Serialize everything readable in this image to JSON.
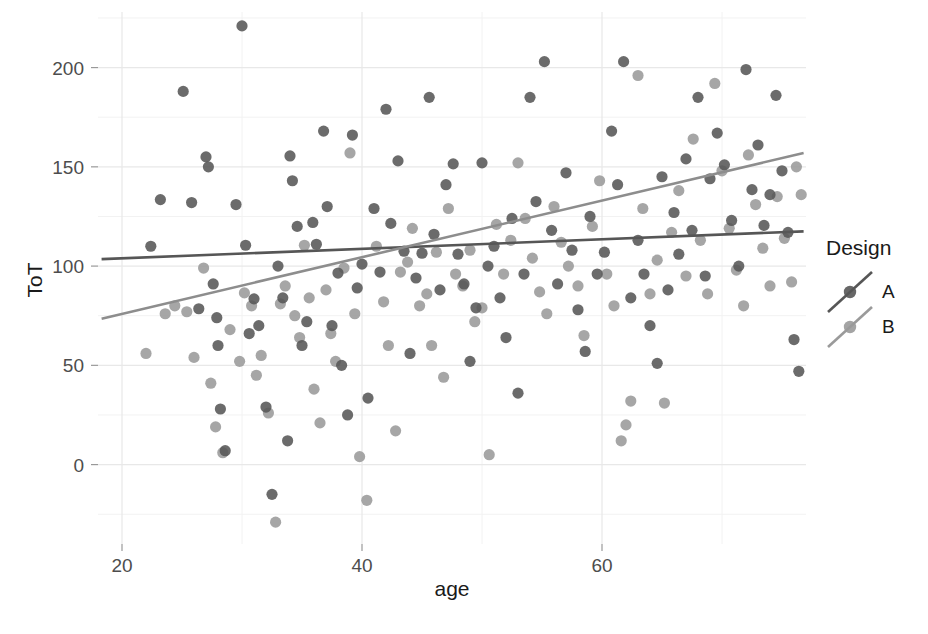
{
  "chart_data": {
    "type": "scatter",
    "title": "",
    "xlabel": "age",
    "ylabel": "ToT",
    "xlim": [
      18,
      77
    ],
    "ylim": [
      -40,
      228
    ],
    "xticks": [
      20,
      40,
      60
    ],
    "yticks": [
      0,
      50,
      100,
      150,
      200
    ],
    "grid": true,
    "legend": {
      "title": "Design",
      "position": "right",
      "entries": [
        {
          "name": "A",
          "color": "#565656",
          "marker": "circle"
        },
        {
          "name": "B",
          "color": "#9a9a9a",
          "marker": "circle"
        }
      ]
    },
    "trend_lines": [
      {
        "name": "A",
        "color": "#565656",
        "x0": 18.3,
        "y0": 103.5,
        "x1": 76.8,
        "y1": 117.5
      },
      {
        "name": "B",
        "color": "#8d8d8d",
        "x0": 18.3,
        "y0": 73.5,
        "x1": 76.8,
        "y1": 157.0
      }
    ],
    "series": [
      {
        "name": "A",
        "color": "#565656",
        "points": [
          [
            22.4,
            110.0
          ],
          [
            23.2,
            133.5
          ],
          [
            25.1,
            188.0
          ],
          [
            25.8,
            132.0
          ],
          [
            26.4,
            78.5
          ],
          [
            27.0,
            155.0
          ],
          [
            27.2,
            150.0
          ],
          [
            27.6,
            91.0
          ],
          [
            27.9,
            74.0
          ],
          [
            28.0,
            60.0
          ],
          [
            28.2,
            28.0
          ],
          [
            28.6,
            7.0
          ],
          [
            29.5,
            131.0
          ],
          [
            30.0,
            221.0
          ],
          [
            30.3,
            110.5
          ],
          [
            30.6,
            66.0
          ],
          [
            31.0,
            83.5
          ],
          [
            31.4,
            70.0
          ],
          [
            32.0,
            29.0
          ],
          [
            32.5,
            -15.0
          ],
          [
            33.0,
            100.0
          ],
          [
            33.4,
            84.0
          ],
          [
            33.8,
            12.0
          ],
          [
            34.0,
            155.5
          ],
          [
            34.2,
            143.0
          ],
          [
            34.6,
            120.0
          ],
          [
            35.0,
            60.0
          ],
          [
            35.4,
            72.0
          ],
          [
            35.9,
            122.0
          ],
          [
            36.2,
            111.0
          ],
          [
            36.8,
            168.0
          ],
          [
            37.1,
            130.0
          ],
          [
            37.5,
            70.0
          ],
          [
            38.0,
            96.5
          ],
          [
            38.3,
            50.0
          ],
          [
            38.8,
            25.0
          ],
          [
            39.2,
            166.0
          ],
          [
            39.6,
            89.0
          ],
          [
            40.0,
            101.0
          ],
          [
            40.5,
            33.5
          ],
          [
            41.0,
            129.0
          ],
          [
            41.5,
            97.0
          ],
          [
            42.0,
            179.0
          ],
          [
            42.4,
            121.5
          ],
          [
            43.0,
            153.0
          ],
          [
            43.5,
            107.5
          ],
          [
            44.0,
            56.0
          ],
          [
            44.5,
            94.0
          ],
          [
            45.0,
            106.5
          ],
          [
            45.6,
            185.0
          ],
          [
            46.0,
            116.0
          ],
          [
            46.5,
            88.0
          ],
          [
            47.0,
            141.0
          ],
          [
            47.6,
            151.5
          ],
          [
            48.0,
            106.0
          ],
          [
            48.5,
            91.0
          ],
          [
            49.0,
            52.0
          ],
          [
            49.5,
            79.0
          ],
          [
            50.0,
            152.0
          ],
          [
            50.5,
            100.0
          ],
          [
            51.0,
            110.0
          ],
          [
            51.5,
            84.0
          ],
          [
            52.0,
            64.0
          ],
          [
            52.5,
            124.0
          ],
          [
            53.0,
            36.0
          ],
          [
            53.5,
            96.0
          ],
          [
            54.0,
            185.0
          ],
          [
            54.5,
            132.5
          ],
          [
            55.2,
            203.0
          ],
          [
            55.8,
            118.0
          ],
          [
            56.3,
            91.0
          ],
          [
            57.0,
            147.0
          ],
          [
            57.5,
            108.0
          ],
          [
            58.0,
            78.0
          ],
          [
            58.6,
            57.0
          ],
          [
            59.0,
            125.0
          ],
          [
            59.6,
            96.0
          ],
          [
            60.2,
            107.0
          ],
          [
            60.8,
            168.0
          ],
          [
            61.3,
            141.0
          ],
          [
            61.8,
            203.0
          ],
          [
            62.4,
            84.0
          ],
          [
            63.0,
            113.0
          ],
          [
            63.5,
            96.0
          ],
          [
            64.0,
            70.0
          ],
          [
            64.6,
            51.0
          ],
          [
            65.0,
            145.0
          ],
          [
            65.5,
            88.0
          ],
          [
            66.0,
            127.0
          ],
          [
            66.4,
            106.0
          ],
          [
            67.0,
            154.0
          ],
          [
            67.5,
            118.0
          ],
          [
            68.0,
            185.0
          ],
          [
            68.6,
            95.0
          ],
          [
            69.0,
            144.0
          ],
          [
            69.6,
            167.0
          ],
          [
            70.2,
            151.0
          ],
          [
            70.8,
            123.0
          ],
          [
            71.4,
            100.0
          ],
          [
            72.0,
            199.0
          ],
          [
            72.5,
            138.5
          ],
          [
            73.0,
            161.0
          ],
          [
            73.5,
            120.5
          ],
          [
            74.0,
            136.0
          ],
          [
            74.5,
            186.0
          ],
          [
            75.0,
            148.0
          ],
          [
            75.5,
            117.0
          ],
          [
            76.0,
            63.0
          ],
          [
            76.4,
            47.0
          ]
        ]
      },
      {
        "name": "B",
        "color": "#9a9a9a",
        "points": [
          [
            22.0,
            56.0
          ],
          [
            23.6,
            76.0
          ],
          [
            24.4,
            80.0
          ],
          [
            25.4,
            77.0
          ],
          [
            26.0,
            54.0
          ],
          [
            26.8,
            99.0
          ],
          [
            27.4,
            41.0
          ],
          [
            27.8,
            19.0
          ],
          [
            28.4,
            6.0
          ],
          [
            29.0,
            68.0
          ],
          [
            29.8,
            52.0
          ],
          [
            30.2,
            86.5
          ],
          [
            30.8,
            80.0
          ],
          [
            31.2,
            45.0
          ],
          [
            31.6,
            55.0
          ],
          [
            32.2,
            26.0
          ],
          [
            32.8,
            -29.0
          ],
          [
            33.2,
            81.0
          ],
          [
            33.6,
            90.0
          ],
          [
            34.4,
            75.0
          ],
          [
            34.8,
            64.0
          ],
          [
            35.2,
            110.5
          ],
          [
            35.6,
            84.0
          ],
          [
            36.0,
            38.0
          ],
          [
            36.5,
            21.0
          ],
          [
            37.0,
            88.0
          ],
          [
            37.4,
            66.0
          ],
          [
            37.8,
            52.0
          ],
          [
            38.5,
            99.0
          ],
          [
            39.0,
            157.0
          ],
          [
            39.4,
            76.0
          ],
          [
            39.8,
            4.0
          ],
          [
            40.4,
            -18.0
          ],
          [
            41.2,
            110.0
          ],
          [
            41.8,
            82.0
          ],
          [
            42.2,
            60.0
          ],
          [
            42.8,
            17.0
          ],
          [
            43.2,
            97.0
          ],
          [
            43.8,
            102.0
          ],
          [
            44.2,
            119.0
          ],
          [
            44.8,
            80.0
          ],
          [
            45.4,
            86.0
          ],
          [
            45.8,
            60.0
          ],
          [
            46.2,
            107.0
          ],
          [
            46.8,
            44.0
          ],
          [
            47.2,
            129.0
          ],
          [
            47.8,
            96.0
          ],
          [
            48.4,
            90.0
          ],
          [
            49.0,
            108.0
          ],
          [
            49.4,
            72.0
          ],
          [
            50.0,
            79.0
          ],
          [
            50.6,
            5.0
          ],
          [
            51.2,
            121.0
          ],
          [
            51.8,
            96.0
          ],
          [
            52.4,
            113.0
          ],
          [
            53.0,
            152.0
          ],
          [
            53.6,
            124.0
          ],
          [
            54.2,
            104.0
          ],
          [
            54.8,
            87.0
          ],
          [
            55.4,
            76.0
          ],
          [
            56.0,
            130.0
          ],
          [
            56.6,
            112.0
          ],
          [
            57.2,
            100.0
          ],
          [
            58.0,
            90.0
          ],
          [
            58.5,
            65.0
          ],
          [
            59.2,
            120.0
          ],
          [
            59.8,
            143.0
          ],
          [
            60.4,
            96.0
          ],
          [
            61.0,
            80.0
          ],
          [
            61.6,
            12.0
          ],
          [
            62.0,
            20.0
          ],
          [
            62.4,
            32.0
          ],
          [
            63.0,
            196.0
          ],
          [
            63.4,
            129.0
          ],
          [
            64.0,
            86.0
          ],
          [
            64.6,
            103.0
          ],
          [
            65.2,
            31.0
          ],
          [
            65.8,
            117.0
          ],
          [
            66.4,
            138.0
          ],
          [
            67.0,
            95.0
          ],
          [
            67.6,
            164.0
          ],
          [
            68.2,
            113.0
          ],
          [
            68.8,
            86.0
          ],
          [
            69.4,
            192.0
          ],
          [
            70.0,
            148.0
          ],
          [
            70.6,
            119.0
          ],
          [
            71.2,
            98.0
          ],
          [
            71.8,
            80.0
          ],
          [
            72.2,
            156.0
          ],
          [
            72.8,
            131.0
          ],
          [
            73.4,
            109.0
          ],
          [
            74.0,
            90.0
          ],
          [
            74.6,
            135.0
          ],
          [
            75.2,
            114.0
          ],
          [
            75.8,
            92.0
          ],
          [
            76.2,
            150.0
          ],
          [
            76.6,
            136.0
          ]
        ]
      }
    ]
  },
  "axes": {
    "x_label": "age",
    "y_label": "ToT",
    "x_tick_labels": [
      "20",
      "40",
      "60"
    ],
    "y_tick_labels": [
      "0",
      "50",
      "100",
      "150",
      "200"
    ]
  },
  "legend": {
    "title": "Design",
    "item_a": "A",
    "item_b": "B"
  }
}
